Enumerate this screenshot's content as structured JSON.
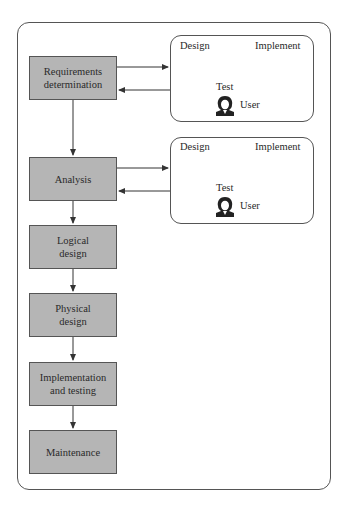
{
  "diagram": {
    "phases": [
      {
        "label_line1": "Requirements",
        "label_line2": "determination"
      },
      {
        "label_line1": "Analysis",
        "label_line2": ""
      },
      {
        "label_line1": "Logical",
        "label_line2": "design"
      },
      {
        "label_line1": "Physical",
        "label_line2": "design"
      },
      {
        "label_line1": "Implementation",
        "label_line2": "and testing"
      },
      {
        "label_line1": "Maintenance",
        "label_line2": ""
      }
    ],
    "prototype_loops": [
      {
        "design": "Design",
        "implement": "Implement",
        "test": "Test",
        "user": "User",
        "user_icon": "user-icon"
      },
      {
        "design": "Design",
        "implement": "Implement",
        "test": "Test",
        "user": "User",
        "user_icon": "user-icon"
      }
    ],
    "colors": {
      "phase_fill": "#b5b5b5",
      "stroke": "#555555",
      "background": "#ffffff"
    }
  }
}
